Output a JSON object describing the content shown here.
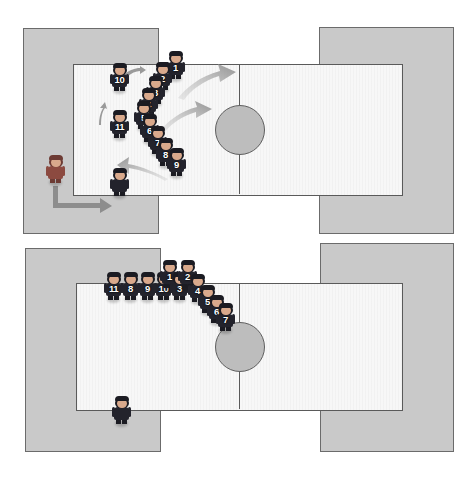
{
  "figure": {
    "type": "diagram",
    "panel_count": 2
  },
  "colors": {
    "zone_fill": "#c9c9c9",
    "zone_stroke": "#6b6b6b",
    "pitch_fill": "#f7f7f7",
    "pitch_stroke": "#5a5a5a",
    "circle_fill": "#bdbdbd",
    "player_jersey": "#23232c",
    "coach_jersey": "#8c4a40",
    "number_text": "#ffffff",
    "arrow_fill": "#9a9a9a",
    "page_background": "#ffffff"
  },
  "panels": [
    {
      "id": "panel-top",
      "name": "top-diagram-phase-1",
      "left_zone": {
        "x": 23,
        "y": 28,
        "w": 134,
        "h": 204
      },
      "right_zone": {
        "x": 319,
        "y": 27,
        "w": 133,
        "h": 205
      },
      "pitch": {
        "x": 73,
        "y": 64,
        "w": 328,
        "h": 130
      },
      "halfline_x": 239,
      "center_circle": {
        "cx": 239,
        "cy": 129,
        "r": 24
      },
      "players": [
        {
          "number": "1",
          "x": 166,
          "y": 51
        },
        {
          "number": "2",
          "x": 153,
          "y": 62
        },
        {
          "number": "3",
          "x": 146,
          "y": 76
        },
        {
          "number": "4",
          "x": 139,
          "y": 88
        },
        {
          "number": "5",
          "x": 134,
          "y": 101
        },
        {
          "number": "6",
          "x": 140,
          "y": 114
        },
        {
          "number": "7",
          "x": 148,
          "y": 126
        },
        {
          "number": "8",
          "x": 156,
          "y": 138
        },
        {
          "number": "9",
          "x": 167,
          "y": 148
        },
        {
          "number": "10",
          "x": 110,
          "y": 63
        },
        {
          "number": "11",
          "x": 110,
          "y": 110
        }
      ],
      "extra_figures": [
        {
          "role": "coach",
          "name": "coach-figure",
          "x": 46,
          "y": 155
        },
        {
          "role": "player",
          "name": "waiting-player",
          "x": 110,
          "y": 168
        }
      ],
      "arrows": [
        {
          "name": "arrow-upper-right-sweep",
          "shape": "curve-up-right",
          "x": 176,
          "y": 66,
          "w": 56,
          "h": 32
        },
        {
          "name": "arrow-lower-right-sweep",
          "shape": "curve-up-right",
          "x": 160,
          "y": 102,
          "w": 50,
          "h": 28
        },
        {
          "name": "arrow-bottom-left-sweep",
          "shape": "curve-up-left",
          "x": 118,
          "y": 157,
          "w": 48,
          "h": 24
        },
        {
          "name": "arrow-to-player-10",
          "shape": "short-right",
          "x": 124,
          "y": 70,
          "w": 20,
          "h": 10
        },
        {
          "name": "arrow-up-to-player-11",
          "shape": "short-up",
          "x": 99,
          "y": 104,
          "w": 9,
          "h": 20
        },
        {
          "name": "arrow-coach-entry",
          "shape": "elbow-down-right",
          "x": 52,
          "y": 189,
          "w": 58,
          "h": 26
        }
      ]
    },
    {
      "id": "panel-bottom",
      "name": "bottom-diagram-phase-2",
      "left_zone": {
        "x": 25,
        "y": 248,
        "w": 134,
        "h": 202
      },
      "right_zone": {
        "x": 320,
        "y": 243,
        "w": 132,
        "h": 207
      },
      "pitch": {
        "x": 76,
        "y": 283,
        "w": 325,
        "h": 126
      },
      "halfline_x": 239,
      "center_circle": {
        "cx": 239,
        "cy": 346,
        "r": 24
      },
      "players": [
        {
          "number": "11",
          "x": 104,
          "y": 272
        },
        {
          "number": "8",
          "x": 121,
          "y": 272
        },
        {
          "number": "9",
          "x": 138,
          "y": 272
        },
        {
          "number": "10",
          "x": 154,
          "y": 272
        },
        {
          "number": "1",
          "x": 160,
          "y": 260
        },
        {
          "number": "3",
          "x": 170,
          "y": 272
        },
        {
          "number": "2",
          "x": 178,
          "y": 260
        },
        {
          "number": "4",
          "x": 188,
          "y": 274
        },
        {
          "number": "5",
          "x": 198,
          "y": 285
        },
        {
          "number": "6",
          "x": 207,
          "y": 295
        },
        {
          "number": "7",
          "x": 216,
          "y": 303
        }
      ],
      "extra_figures": [
        {
          "role": "player",
          "name": "waiting-player",
          "x": 112,
          "y": 396
        }
      ],
      "arrows": []
    }
  ]
}
